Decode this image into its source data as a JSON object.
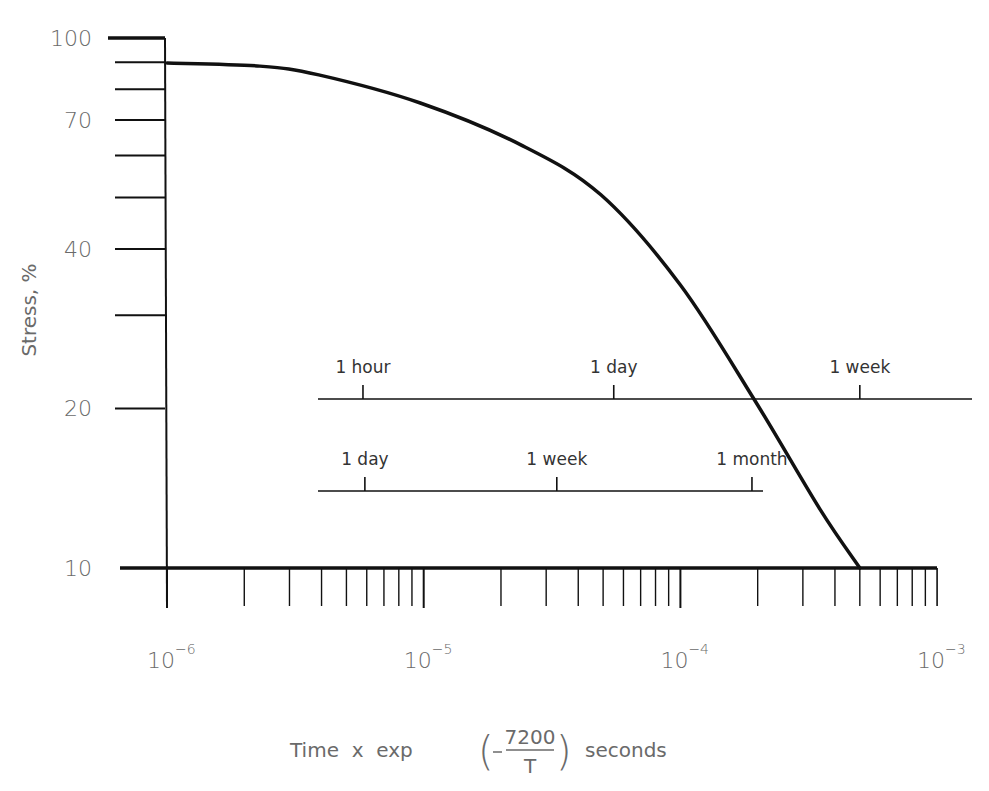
{
  "chart_data": {
    "type": "line",
    "title": "",
    "xlabel": "Time x exp (-7200/T) seconds",
    "ylabel": "Stress, %",
    "x_scale": "log",
    "y_scale": "log",
    "xlim": [
      1e-06,
      0.001
    ],
    "ylim": [
      10,
      100
    ],
    "grid": false,
    "legend": null,
    "x_tick_labels": [
      {
        "base": "10",
        "exp": "−6",
        "value": 1e-06
      },
      {
        "base": "10",
        "exp": "−5",
        "value": 1e-05
      },
      {
        "base": "10",
        "exp": "−4",
        "value": 0.0001
      },
      {
        "base": "10",
        "exp": "−3",
        "value": 0.001
      }
    ],
    "y_tick_labels": [
      "100",
      "70",
      "40",
      "20",
      "10"
    ],
    "y_ticks": [
      100,
      90,
      80,
      70,
      60,
      50,
      40,
      30,
      20,
      10
    ],
    "series": [
      {
        "name": "Stress relaxation curve",
        "x": [
          1e-06,
          2.3e-06,
          3.9e-06,
          9.7e-06,
          2.4e-05,
          4.9e-05,
          0.0001,
          0.000195,
          0.00035,
          0.0005
        ],
        "y": [
          89.7,
          88.5,
          85.2,
          75.4,
          62.8,
          50.6,
          34.2,
          20.7,
          12.9,
          10.0
        ]
      }
    ],
    "annotations": {
      "time_scale_upper": {
        "stress_level": 20.5,
        "ticks": [
          {
            "label": "1 hour",
            "x": 5.8e-06
          },
          {
            "label": "1 day",
            "x": 5.5e-05
          },
          {
            "label": "1 week",
            "x": 0.0005
          }
        ]
      },
      "time_scale_lower": {
        "stress_level": 14.4,
        "ticks": [
          {
            "label": "1 day",
            "x": 5.9e-06
          },
          {
            "label": "1 week",
            "x": 3.3e-05
          },
          {
            "label": "1 month",
            "x": 0.00019
          }
        ]
      }
    }
  },
  "axes": {
    "ylabel": "Stress, %",
    "xlabel_prefix": "Time  x  exp",
    "xlabel_numerator": "7200",
    "xlabel_denominator": "T",
    "xlabel_suffix": "seconds"
  },
  "scales": {
    "upper": [
      "1 hour",
      "1 day",
      "1 week"
    ],
    "lower": [
      "1 day",
      "1 week",
      "1 month"
    ]
  },
  "colors": {
    "line": "#111111",
    "label": "#6a6a6a",
    "background": "#ffffff"
  }
}
